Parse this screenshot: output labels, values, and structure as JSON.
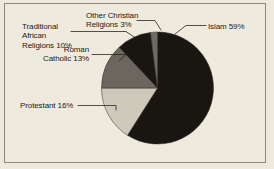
{
  "chart_data": {
    "type": "pie",
    "title": "",
    "subtitle": "",
    "xlabel": "",
    "ylabel": "",
    "legend_position": "none",
    "grid": false,
    "labels_outside": true,
    "start_angle_deg": 0,
    "direction": "clockwise",
    "categories": [
      "Islam",
      "Protestant",
      "Roman Catholic",
      "Traditional African Religions",
      "Other Christian Religions"
    ],
    "values": [
      59,
      16,
      13,
      10,
      3
    ],
    "unit": "%",
    "colors": [
      "#191612",
      "#cfc9bc",
      "#6b665e",
      "#191612",
      "#6f6a61"
    ],
    "slices": [
      {
        "name": "Islam",
        "value": 59,
        "label": "Islam 59%",
        "color": "#191612",
        "start_deg": 0,
        "end_deg": 212.4
      },
      {
        "name": "Protestant",
        "value": 16,
        "label": "Protestant 16%",
        "color": "#cfc9bc",
        "start_deg": 212.4,
        "end_deg": 270.0
      },
      {
        "name": "Roman Catholic",
        "value": 13,
        "label": "Roman\nCatholic 13%",
        "color": "#6b665e",
        "start_deg": 270.0,
        "end_deg": 316.8
      },
      {
        "name": "Traditional African Religions",
        "value": 10,
        "label": "Traditional\nAfrican\nReligions 10%",
        "color": "#191612",
        "start_deg": 316.8,
        "end_deg": 352.8
      },
      {
        "name": "Other Christian Religions",
        "value": 3,
        "label": "Other Christian\nReligions 3%",
        "color": "#6f6a61",
        "start_deg": 352.8,
        "end_deg": 360.0
      }
    ]
  },
  "labels": {
    "islam": "Islam 59%",
    "protestant": "Protestant 16%",
    "roman_catholic": "Roman\nCatholic 13%",
    "traditional_african": "Traditional\nAfrican\nReligions 10%",
    "other_christian": "Other Christian\nReligions 3%"
  },
  "style": {
    "background": "#eee9dc",
    "frame_border": "#8d8878",
    "text_color": "#1b1b18",
    "leader_line_color": "#2a2722",
    "dark_slice": "#191612",
    "mid_slice": "#6b665e",
    "light_slice": "#cfc9bc"
  }
}
